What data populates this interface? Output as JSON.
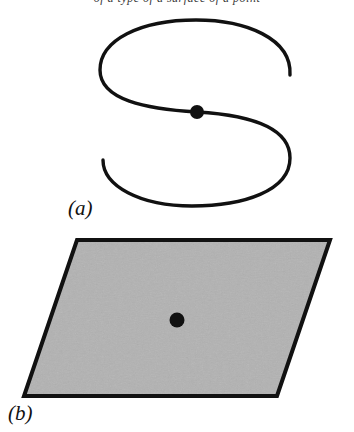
{
  "figure": {
    "top_caption_remnant": "of a type of a surface of a point",
    "background_color": "#ffffff",
    "ink_color": "#111111",
    "panels": [
      {
        "id": "a",
        "label": "(a)",
        "kind": "s-curve",
        "description": "Freehand S-shaped curve with a single filled point marked at its center crossing",
        "stroke_color": "#111111",
        "stroke_width": 3.4,
        "point": {
          "cx": 197,
          "cy": 104,
          "r": 7,
          "fill": "#111111"
        },
        "path": "M 290 67 C 292 30, 245 12, 196 12 C 140 12, 100 32, 100 62 C 100 92, 146 101, 197 104 C 248 107, 290 118, 290 150 C 290 183, 243 198, 192 198 C 140 198, 103 178, 103 152"
      },
      {
        "id": "b",
        "label": "(b)",
        "kind": "parallelogram",
        "description": "Shaded parallelogram representing a tangent plane, with a single filled point at its center",
        "fill_color": "#b2b2b2",
        "stroke_color": "#111111",
        "stroke_width": 4,
        "corners": [
          {
            "name": "top-left",
            "x": 77,
            "y": 12
          },
          {
            "name": "top-right",
            "x": 330,
            "y": 12
          },
          {
            "name": "bottom-right",
            "x": 277,
            "y": 168
          },
          {
            "name": "bottom-left",
            "x": 24,
            "y": 168
          }
        ],
        "point": {
          "cx": 177,
          "cy": 92,
          "r": 7.5,
          "fill": "#111111"
        }
      }
    ]
  }
}
